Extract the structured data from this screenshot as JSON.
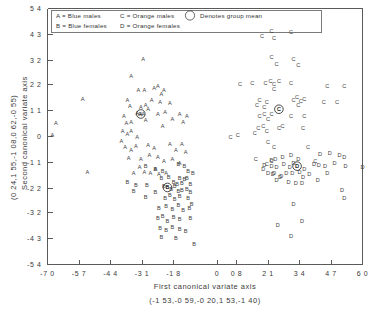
{
  "chart_data": {
    "type": "scatter",
    "title": "",
    "xlabel": "First canonical variate axis",
    "xlabel_sub": "(-1 53,-0 59,-0 20,1 53,-1 40)",
    "ylabel": "Second canonical variate axis",
    "ylabel_sub": "(0 24,1 55,-1 08,0 62,-0 55)",
    "xlim": [
      -7.0,
      6.0
    ],
    "ylim": [
      -5.4,
      5.4
    ],
    "grid": false,
    "legend_position": "top-left-inside",
    "xticks": [
      "-7 0",
      "-5 7",
      "-4 4",
      "-3 1",
      "-1 8",
      "0",
      "0 8",
      "2 1",
      "3 4",
      "4 7",
      "6 0"
    ],
    "xtick_values": [
      -7.0,
      -5.7,
      -4.4,
      -3.1,
      -1.8,
      0,
      0.8,
      2.1,
      3.4,
      4.7,
      6.0
    ],
    "yticks": [
      "5 4",
      "4 3",
      "3 2",
      "2 2",
      "1 1",
      "0",
      "-1 1",
      "-2 2",
      "-3 2",
      "-4 3",
      "-5 4"
    ],
    "ytick_values": [
      5.4,
      4.3,
      3.2,
      2.2,
      1.1,
      0,
      -1.1,
      -2.2,
      -3.2,
      -4.3,
      -5.4
    ],
    "legend": [
      {
        "symbol": "A",
        "label": "A = Blue males"
      },
      {
        "symbol": "B",
        "label": "B = Blue females"
      },
      {
        "symbol": "C",
        "label": "C = Orange males"
      },
      {
        "symbol": "D",
        "label": "D = Orange females"
      },
      {
        "symbol": "circle",
        "label": "Denotes group mean"
      }
    ],
    "series": [
      {
        "name": "A",
        "label": "Blue males",
        "marker": "A",
        "mean": [
          -3.15,
          0.95
        ],
        "points": [
          [
            -3.05,
            3.25
          ],
          [
            -3.55,
            2.55
          ],
          [
            -5.55,
            1.6
          ],
          [
            -6.65,
            0.55
          ],
          [
            -3.7,
            1.55
          ],
          [
            -3.25,
            1.95
          ],
          [
            -3.0,
            1.95
          ],
          [
            -2.6,
            2.05
          ],
          [
            -2.45,
            2.15
          ],
          [
            -2.3,
            1.8
          ],
          [
            -2.2,
            1.95
          ],
          [
            -3.6,
            1.3
          ],
          [
            -3.3,
            1.0
          ],
          [
            -3.15,
            1.25
          ],
          [
            -2.95,
            1.35
          ],
          [
            -2.85,
            1.15
          ],
          [
            -2.7,
            1.55
          ],
          [
            -2.35,
            1.45
          ],
          [
            -3.85,
            0.85
          ],
          [
            -3.75,
            0.55
          ],
          [
            -3.55,
            0.6
          ],
          [
            -2.45,
            0.95
          ],
          [
            -2.15,
            1.05
          ],
          [
            -1.95,
            1.4
          ],
          [
            -3.9,
            0.25
          ],
          [
            -3.7,
            0.1
          ],
          [
            -3.55,
            0.25
          ],
          [
            -3.3,
            0.0
          ],
          [
            -3.2,
            0.95
          ],
          [
            -3.05,
            0.95
          ],
          [
            -2.95,
            0.7
          ],
          [
            -2.25,
            0.45
          ],
          [
            -1.85,
            0.75
          ],
          [
            -1.55,
            0.95
          ],
          [
            -1.4,
            0.6
          ],
          [
            -1.25,
            0.85
          ],
          [
            -6.8,
            0.05
          ],
          [
            -3.95,
            -0.2
          ],
          [
            -3.8,
            -0.45
          ],
          [
            -3.55,
            -0.55
          ],
          [
            -3.35,
            -0.4
          ],
          [
            -2.85,
            -0.35
          ],
          [
            -2.6,
            -0.5
          ],
          [
            -1.95,
            -0.3
          ],
          [
            -1.7,
            -0.55
          ],
          [
            -1.45,
            -0.3
          ],
          [
            -1.3,
            -0.65
          ],
          [
            -3.65,
            -0.9
          ],
          [
            -3.15,
            -0.95
          ],
          [
            -2.8,
            -0.8
          ],
          [
            -2.45,
            -0.85
          ],
          [
            -2.2,
            -1.05
          ],
          [
            -1.85,
            -0.95
          ],
          [
            -1.55,
            -1.1
          ],
          [
            -5.35,
            -1.5
          ],
          [
            -3.45,
            -1.55
          ],
          [
            -3.2,
            -1.3
          ],
          [
            -3.0,
            -1.5
          ],
          [
            -2.75,
            -1.55
          ],
          [
            -2.55,
            -1.35
          ],
          [
            -2.4,
            -1.6
          ],
          [
            -2.1,
            -1.55
          ]
        ]
      },
      {
        "name": "B",
        "label": "Blue females",
        "marker": "B",
        "mean": [
          -2.05,
          -2.15
        ],
        "points": [
          [
            -2.95,
            -1.25
          ],
          [
            -2.55,
            -1.35
          ],
          [
            -2.25,
            -1.45
          ],
          [
            -1.6,
            -1.15
          ],
          [
            -1.35,
            -1.25
          ],
          [
            -1.2,
            -1.45
          ],
          [
            -1.55,
            -1.75
          ],
          [
            -1.35,
            -1.8
          ],
          [
            -2.3,
            -1.75
          ],
          [
            -2.0,
            -1.7
          ],
          [
            -1.8,
            -1.9
          ],
          [
            -1.65,
            -2.0
          ],
          [
            -1.45,
            -1.95
          ],
          [
            -1.25,
            -1.75
          ],
          [
            -1.1,
            -2.0
          ],
          [
            -3.35,
            -2.05
          ],
          [
            -2.9,
            -2.05
          ],
          [
            -2.55,
            -2.35
          ],
          [
            -2.2,
            -2.1
          ],
          [
            -2.05,
            -2.15
          ],
          [
            -1.9,
            -2.2
          ],
          [
            -1.75,
            -2.1
          ],
          [
            -1.6,
            -2.3
          ],
          [
            -1.45,
            -2.25
          ],
          [
            -1.25,
            -2.2
          ],
          [
            -1.1,
            -2.35
          ],
          [
            -2.95,
            -2.55
          ],
          [
            -2.15,
            -2.6
          ],
          [
            -1.95,
            -2.45
          ],
          [
            -1.75,
            -2.65
          ],
          [
            -1.55,
            -2.5
          ],
          [
            -1.2,
            -2.6
          ],
          [
            -2.4,
            -3.0
          ],
          [
            -2.1,
            -2.95
          ],
          [
            -1.85,
            -3.05
          ],
          [
            -1.6,
            -2.9
          ],
          [
            -1.4,
            -3.1
          ],
          [
            -1.15,
            -3.0
          ],
          [
            -2.45,
            -3.45
          ],
          [
            -2.25,
            -3.35
          ],
          [
            -2.05,
            -3.55
          ],
          [
            -1.8,
            -3.4
          ],
          [
            -1.55,
            -3.5
          ],
          [
            -1.1,
            -3.45
          ],
          [
            -2.35,
            -3.85
          ],
          [
            -2.1,
            -3.95
          ],
          [
            -1.85,
            -3.8
          ],
          [
            -1.55,
            -3.9
          ],
          [
            -2.3,
            -4.25
          ],
          [
            -1.7,
            -4.3
          ],
          [
            -0.95,
            -4.55
          ],
          [
            -3.7,
            -1.9
          ],
          [
            -3.45,
            -2.3
          ],
          [
            -1.0,
            -1.55
          ],
          [
            -1.05,
            -2.85
          ],
          [
            -1.3,
            -4.0
          ]
        ]
      },
      {
        "name": "C",
        "label": "Orange males",
        "marker": "C",
        "mean": [
          2.55,
          1.15
        ],
        "points": [
          [
            1.85,
            4.25
          ],
          [
            2.25,
            4.45
          ],
          [
            2.35,
            4.15
          ],
          [
            3.05,
            4.4
          ],
          [
            2.25,
            3.35
          ],
          [
            2.45,
            3.05
          ],
          [
            3.15,
            3.25
          ],
          [
            3.35,
            3.0
          ],
          [
            0.95,
            2.2
          ],
          [
            1.45,
            2.25
          ],
          [
            2.0,
            2.25
          ],
          [
            2.2,
            2.35
          ],
          [
            2.35,
            2.2
          ],
          [
            2.55,
            2.35
          ],
          [
            2.35,
            2.0
          ],
          [
            3.05,
            2.25
          ],
          [
            4.55,
            2.15
          ],
          [
            5.25,
            2.15
          ],
          [
            1.75,
            1.55
          ],
          [
            1.65,
            1.35
          ],
          [
            1.95,
            1.25
          ],
          [
            2.05,
            1.45
          ],
          [
            2.55,
            1.15
          ],
          [
            3.15,
            1.55
          ],
          [
            3.3,
            1.65
          ],
          [
            3.45,
            1.5
          ],
          [
            3.6,
            1.6
          ],
          [
            3.35,
            1.35
          ],
          [
            4.4,
            1.45
          ],
          [
            4.95,
            1.45
          ],
          [
            1.75,
            0.85
          ],
          [
            1.95,
            0.95
          ],
          [
            2.1,
            0.75
          ],
          [
            2.25,
            0.95
          ],
          [
            3.05,
            0.85
          ],
          [
            3.6,
            0.85
          ],
          [
            1.7,
            0.35
          ],
          [
            1.9,
            0.45
          ],
          [
            2.05,
            0.25
          ],
          [
            2.55,
            0.35
          ],
          [
            2.7,
            0.45
          ],
          [
            3.55,
            0.35
          ],
          [
            0.85,
            0.05
          ],
          [
            1.55,
            0.15
          ],
          [
            2.1,
            -0.25
          ],
          [
            2.35,
            -0.45
          ],
          [
            3.75,
            -0.45
          ],
          [
            1.6,
            -0.95
          ],
          [
            2.05,
            -1.15
          ],
          [
            2.25,
            -1.05
          ],
          [
            4.05,
            -1.05
          ],
          [
            0.55,
            0.0
          ]
        ]
      },
      {
        "name": "D",
        "label": "Orange females",
        "marker": "D",
        "mean": [
          3.3,
          -1.25
        ],
        "points": [
          [
            2.35,
            -1.55
          ],
          [
            2.45,
            -1.85
          ],
          [
            2.6,
            -1.7
          ],
          [
            2.7,
            -0.85
          ],
          [
            3.05,
            -0.8
          ],
          [
            3.35,
            -0.95
          ],
          [
            3.15,
            -1.1
          ],
          [
            2.4,
            -0.95
          ],
          [
            2.25,
            -1.0
          ],
          [
            4.25,
            -0.75
          ],
          [
            4.65,
            -0.7
          ],
          [
            5.05,
            -0.8
          ],
          [
            5.25,
            -0.85
          ],
          [
            1.95,
            -1.2
          ],
          [
            2.25,
            -1.25
          ],
          [
            2.45,
            -1.3
          ],
          [
            2.75,
            -1.15
          ],
          [
            3.0,
            -1.3
          ],
          [
            3.3,
            -1.25
          ],
          [
            3.6,
            -1.35
          ],
          [
            4.0,
            -1.15
          ],
          [
            4.2,
            -1.2
          ],
          [
            4.45,
            -1.25
          ],
          [
            4.85,
            -1.1
          ],
          [
            5.3,
            -1.25
          ],
          [
            6.0,
            -1.3
          ],
          [
            2.1,
            -1.55
          ],
          [
            2.3,
            -1.6
          ],
          [
            2.65,
            -1.65
          ],
          [
            2.85,
            -1.55
          ],
          [
            3.1,
            -1.55
          ],
          [
            3.4,
            -1.5
          ],
          [
            3.55,
            -1.7
          ],
          [
            3.8,
            -1.6
          ],
          [
            2.95,
            -1.9
          ],
          [
            3.25,
            -1.95
          ],
          [
            3.5,
            -1.95
          ],
          [
            5.15,
            -2.25
          ],
          [
            5.25,
            -2.6
          ],
          [
            3.15,
            -2.85
          ],
          [
            2.5,
            -3.75
          ],
          [
            3.5,
            -3.55
          ],
          [
            3.05,
            -4.2
          ],
          [
            4.15,
            -1.85
          ],
          [
            1.9,
            -1.35
          ],
          [
            4.55,
            -1.55
          ]
        ]
      }
    ]
  }
}
